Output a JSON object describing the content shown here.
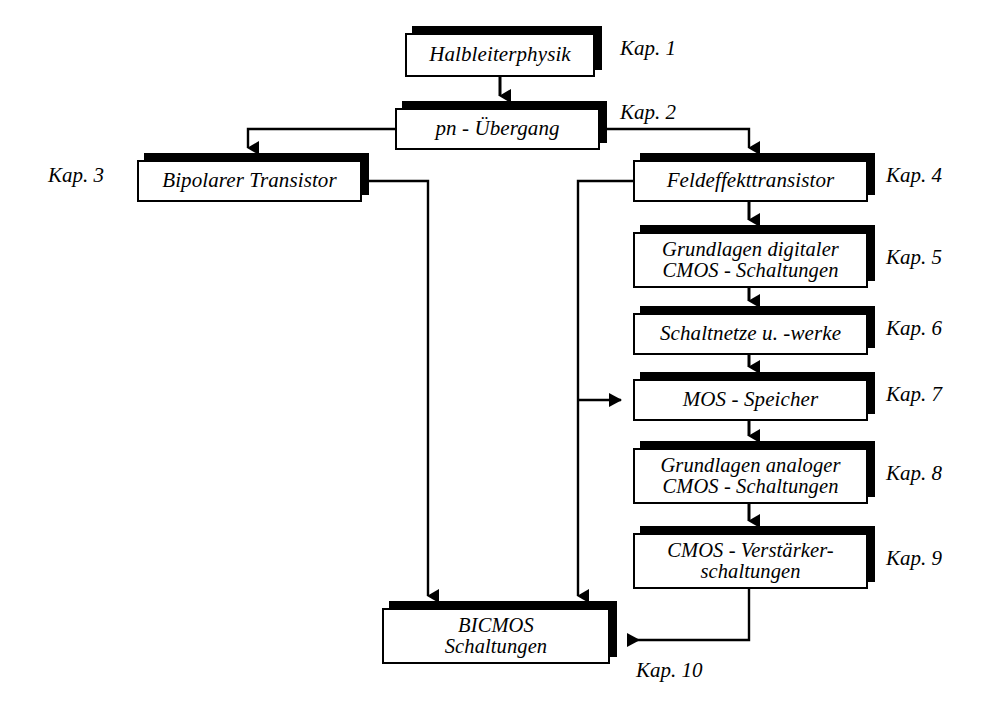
{
  "diagram": {
    "title_text": "",
    "language": "de",
    "colors": {
      "ink": "#000000",
      "paper": "#ffffff"
    },
    "nodes": [
      {
        "id": "n1",
        "label": "Halbleiterphysik",
        "chapter": "Kap. 1",
        "chapter_side": "right",
        "x": 405,
        "y": 33,
        "w": 190,
        "h": 44,
        "lines": 1
      },
      {
        "id": "n2",
        "label": "pn - Übergang",
        "chapter": "Kap. 2",
        "chapter_side": "right",
        "x": 395,
        "y": 108,
        "w": 205,
        "h": 42,
        "lines": 1
      },
      {
        "id": "n3",
        "label": "Bipolarer Transistor",
        "chapter": "Kap. 3",
        "chapter_side": "left",
        "x": 137,
        "y": 160,
        "w": 225,
        "h": 42,
        "lines": 1
      },
      {
        "id": "n4",
        "label": "Feldeffekttransistor",
        "chapter": "Kap. 4",
        "chapter_side": "right",
        "x": 633,
        "y": 160,
        "w": 235,
        "h": 42,
        "lines": 1
      },
      {
        "id": "n5",
        "label": "Grundlagen digitaler\nCMOS - Schaltungen",
        "chapter": "Kap. 5",
        "chapter_side": "right",
        "x": 633,
        "y": 232,
        "w": 235,
        "h": 56,
        "lines": 2
      },
      {
        "id": "n6",
        "label": "Schaltnetze u. -werke",
        "chapter": "Kap. 6",
        "chapter_side": "right",
        "x": 633,
        "y": 313,
        "w": 235,
        "h": 42,
        "lines": 1
      },
      {
        "id": "n7",
        "label": "MOS - Speicher",
        "chapter": "Kap. 7",
        "chapter_side": "right",
        "x": 633,
        "y": 379,
        "w": 235,
        "h": 42,
        "lines": 1
      },
      {
        "id": "n8",
        "label": "Grundlagen analoger\nCMOS - Schaltungen",
        "chapter": "Kap. 8",
        "chapter_side": "right",
        "x": 633,
        "y": 448,
        "w": 235,
        "h": 56,
        "lines": 2
      },
      {
        "id": "n9",
        "label": "CMOS - Verstärker-\nschaltungen",
        "chapter": "Kap. 9",
        "chapter_side": "right",
        "x": 633,
        "y": 533,
        "w": 235,
        "h": 56,
        "lines": 2
      },
      {
        "id": "n10",
        "label": "BICMOS\nSchaltungen",
        "chapter": "Kap. 10",
        "chapter_side": "below-right",
        "x": 382,
        "y": 608,
        "w": 228,
        "h": 56,
        "lines": 2
      }
    ],
    "chapter_labels": [
      {
        "text": "Kap. 1",
        "x": 620,
        "y": 36
      },
      {
        "text": "Kap. 2",
        "x": 620,
        "y": 100
      },
      {
        "text": "Kap. 3",
        "x": 48,
        "y": 163
      },
      {
        "text": "Kap. 4",
        "x": 886,
        "y": 163
      },
      {
        "text": "Kap. 5",
        "x": 886,
        "y": 245
      },
      {
        "text": "Kap. 6",
        "x": 886,
        "y": 316
      },
      {
        "text": "Kap. 7",
        "x": 886,
        "y": 382
      },
      {
        "text": "Kap. 8",
        "x": 886,
        "y": 461
      },
      {
        "text": "Kap. 9",
        "x": 886,
        "y": 546
      },
      {
        "text": "Kap. 10",
        "x": 636,
        "y": 658
      }
    ],
    "edges": [
      {
        "from": "n1",
        "to": "n2",
        "kind": "vertical-arrow"
      },
      {
        "from": "n2",
        "to": "n3",
        "kind": "left-branch-arrow"
      },
      {
        "from": "n2",
        "to": "n4",
        "kind": "right-branch-arrow"
      },
      {
        "from": "n4",
        "to": "n5",
        "kind": "vertical-arrow"
      },
      {
        "from": "n5",
        "to": "n6",
        "kind": "vertical-arrow"
      },
      {
        "from": "n6",
        "to": "n7",
        "kind": "vertical-arrow"
      },
      {
        "from": "n7",
        "to": "n8",
        "kind": "vertical-arrow"
      },
      {
        "from": "n8",
        "to": "n9",
        "kind": "vertical-arrow"
      },
      {
        "from": "n3",
        "to": "n10",
        "kind": "right-down-arrow"
      },
      {
        "from": "n4",
        "to": "n7",
        "kind": "left-bus-arrow"
      },
      {
        "from": "n4",
        "to": "n10",
        "kind": "left-bus-down-arrow"
      },
      {
        "from": "n9",
        "to": "n10",
        "kind": "down-left-side-arrow"
      }
    ]
  }
}
